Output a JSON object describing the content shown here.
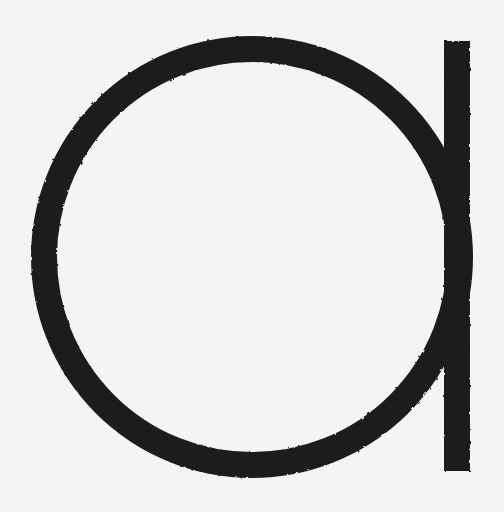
{
  "page": {
    "background": "#fcfcfc"
  },
  "logo": {
    "letter": "a",
    "ink_color": "#1c1c1c",
    "canvas": {
      "width": 504,
      "height": 512
    },
    "ring": {
      "cx": 252,
      "cy": 257,
      "outer_radius": 221,
      "stroke_width": 26
    },
    "stem": {
      "x": 444,
      "y": 41,
      "width": 26,
      "height": 430
    }
  }
}
